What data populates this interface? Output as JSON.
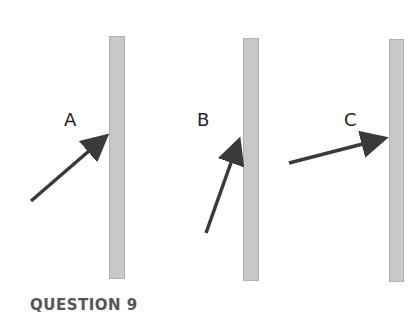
{
  "diagram": {
    "labels": [
      "A",
      "B",
      "C"
    ],
    "bar_color": "#c8c8c8",
    "arrow_color": "#3a3a3a"
  },
  "question": {
    "title": "QUESTION 9"
  }
}
